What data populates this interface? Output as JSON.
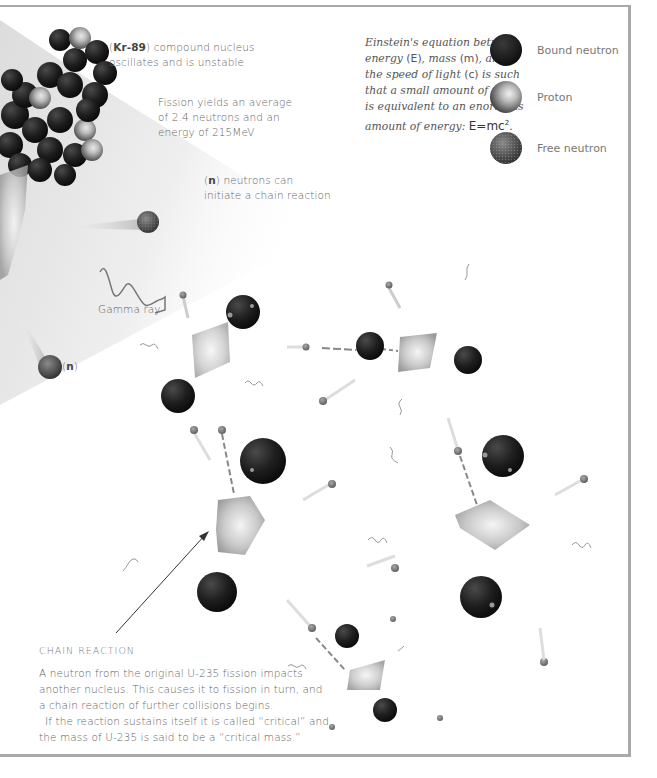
{
  "labels": {
    "kr89_prefix": "(",
    "kr89_symbol": "Kr-89",
    "kr89_line1_rest": ") compound nucleus",
    "kr89_line2": "oscillates and is unstable",
    "fission_yield_line1": "Fission yields an average",
    "fission_yield_line2": "of 2.4 neutrons and an",
    "fission_yield_line3": "energy of 215MeV",
    "neutrons_prefix": "(",
    "neutrons_symbol": "n",
    "neutrons_line1_rest": ") neutrons can",
    "neutrons_line2": "initiate a chain reaction",
    "gamma_ray": "Gamma ray",
    "neutron_tag_prefix": "(",
    "neutron_tag_symbol": "n",
    "neutron_tag_suffix": ")"
  },
  "einstein": {
    "line1": "Einstein's equation between",
    "line2_a": "energy ",
    "line2_b": "(E)",
    "line2_c": ", mass ",
    "line2_d": "(m)",
    "line2_e": ", and",
    "line3_a": "the speed of light ",
    "line3_b": "(c)",
    "line3_c": " is such",
    "line4": "that a small amount of mass",
    "line5": "is equivalent to an enormous",
    "line6_a": "amount of energy: ",
    "equation": "E=mc",
    "exponent": "2",
    "period": "."
  },
  "legend": {
    "items": [
      {
        "label": "Bound neutron",
        "icon": "bound-neutron-sphere",
        "color": "#1a1a1a"
      },
      {
        "label": "Proton",
        "icon": "proton-sphere",
        "color": "#8a8a8a"
      },
      {
        "label": "Free neutron",
        "icon": "free-neutron-sphere",
        "color": "#4a4a4a"
      }
    ]
  },
  "caption": {
    "heading": "CHAIN REACTION",
    "para1": "A neutron from the original U-235 fission impacts another nucleus. This causes it to fission in turn, and a chain reaction of further collisions begins.",
    "para2": "If the reaction sustains itself it is called “critical” and the mass of U-235 is said to be a “critical mass.”"
  },
  "colors": {
    "frame": "#a9a9a9",
    "cone": "#ececec",
    "nucleus_dark": "#1c1c1c",
    "nucleus_highlight": "#9a9a9a",
    "fragment": "#bdbdbd",
    "neutron": "#6e6e6e"
  }
}
